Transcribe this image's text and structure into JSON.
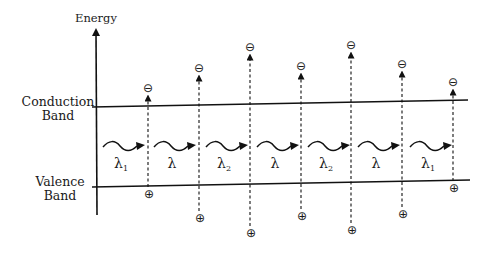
{
  "axis": {
    "label": "Energy"
  },
  "bands": {
    "conduction": {
      "line1": "Conduction",
      "line2": "Band"
    },
    "valence": {
      "line1": "Valence",
      "line2": "Band"
    }
  },
  "symbols": {
    "electron": "⊖",
    "hole": "⊕"
  },
  "transitions": [
    {
      "x": 148,
      "electron_y": 88,
      "hole_y": 194
    },
    {
      "x": 199,
      "electron_y": 68,
      "hole_y": 218
    },
    {
      "x": 250,
      "electron_y": 47,
      "hole_y": 233
    },
    {
      "x": 301,
      "electron_y": 66,
      "hole_y": 216
    },
    {
      "x": 351,
      "electron_y": 45,
      "hole_y": 230
    },
    {
      "x": 402,
      "electron_y": 64,
      "hole_y": 214
    },
    {
      "x": 453,
      "electron_y": 82,
      "hole_y": 188
    }
  ],
  "photons": [
    {
      "x": 103,
      "label": "λ",
      "sub": "1"
    },
    {
      "x": 154,
      "label": "λ",
      "sub": ""
    },
    {
      "x": 206,
      "label": "λ",
      "sub": "2"
    },
    {
      "x": 257,
      "label": "λ",
      "sub": ""
    },
    {
      "x": 308,
      "label": "λ",
      "sub": "2"
    },
    {
      "x": 358,
      "label": "λ",
      "sub": ""
    },
    {
      "x": 410,
      "label": "λ",
      "sub": "1"
    }
  ]
}
